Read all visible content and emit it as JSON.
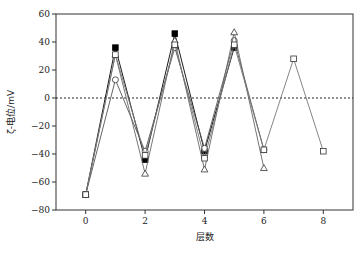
{
  "chart_data": {
    "type": "line",
    "title": "",
    "xlabel": "层数",
    "ylabel": "ζ-电位/mV",
    "xlim": [
      -1,
      9
    ],
    "ylim": [
      -80,
      60
    ],
    "xticks": [
      0,
      2,
      4,
      6,
      8
    ],
    "yticks": [
      -80,
      -60,
      -40,
      -20,
      0,
      20,
      40,
      60
    ],
    "xtick_labels": [
      "0",
      "2",
      "4",
      "6",
      "8"
    ],
    "ytick_labels": [
      "-80",
      "-60",
      "-40",
      "-20",
      "0",
      "20",
      "40",
      "60"
    ],
    "reference_line": {
      "y": 0,
      "style": "dotted"
    },
    "grid": false,
    "legend": null,
    "series": [
      {
        "name": "filled-square",
        "marker": "square-filled",
        "color": "#000000",
        "x": [
          0,
          1,
          2,
          3,
          4,
          5
        ],
        "y": [
          -69,
          36,
          -44,
          46,
          -38,
          36
        ]
      },
      {
        "name": "open-circle",
        "marker": "circle-open",
        "color": "#555555",
        "x": [
          0,
          1,
          2,
          3,
          4,
          5,
          6
        ],
        "y": [
          -69,
          13,
          -38,
          36,
          -36,
          41,
          -37
        ]
      },
      {
        "name": "open-triangle",
        "marker": "triangle-open",
        "color": "#666666",
        "x": [
          0,
          1,
          2,
          3,
          4,
          5,
          6
        ],
        "y": [
          -69,
          31,
          -54,
          41,
          -51,
          47,
          -50
        ]
      },
      {
        "name": "open-square",
        "marker": "square-open",
        "color": "#777777",
        "x": [
          0,
          1,
          2,
          3,
          4,
          5,
          6,
          7,
          8
        ],
        "y": [
          -69,
          31,
          -41,
          38,
          -43,
          38,
          -37,
          28,
          -38
        ]
      }
    ]
  }
}
